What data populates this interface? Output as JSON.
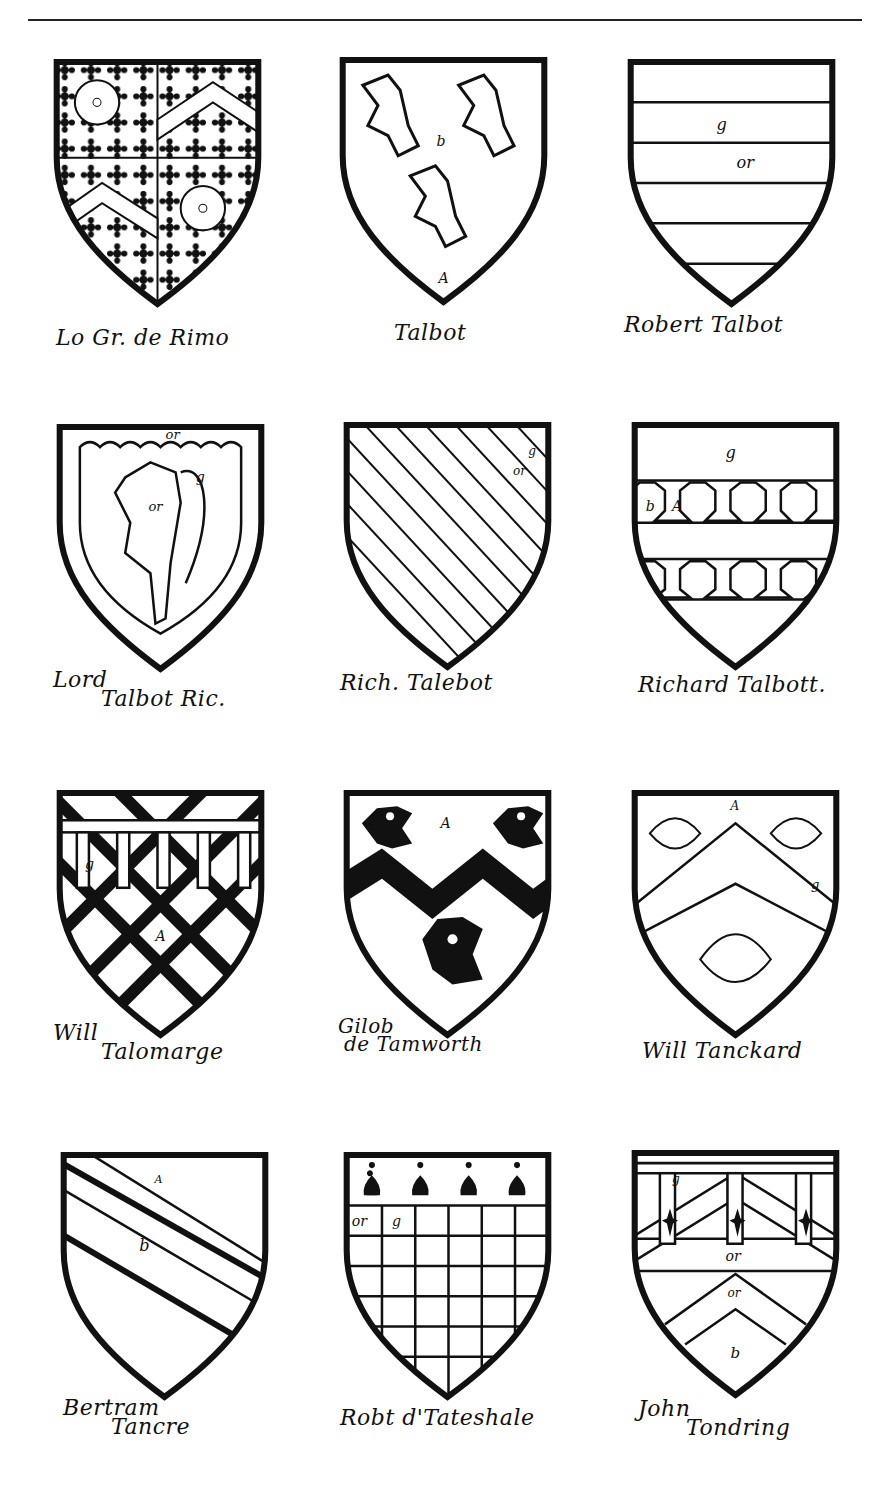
{
  "shields": [
    {
      "id": "r1c1",
      "caption_line1": "Lo Gr. de Rimo",
      "caption_line2": "",
      "labels": [
        "or",
        "g",
        "or",
        "or"
      ],
      "design": "quarterly-crusily-cinquefoil-chevron"
    },
    {
      "id": "r1c2",
      "caption_line1": "Talbot",
      "caption_line2": "",
      "labels": [
        "b",
        "A"
      ],
      "design": "three-lions-rampant"
    },
    {
      "id": "r1c3",
      "caption_line1": "Robert Talbot",
      "caption_line2": "",
      "labels": [
        "g",
        "or"
      ],
      "design": "barry"
    },
    {
      "id": "r2c1",
      "caption_line1": "Lord",
      "caption_line2": "Talbot Ric.",
      "labels": [
        "or",
        "or",
        "g"
      ],
      "design": "lion-within-bordure-engrailed"
    },
    {
      "id": "r2c2",
      "caption_line1": "Rich. Talebot",
      "caption_line2": "",
      "labels": [
        "g",
        "or"
      ],
      "design": "bendy"
    },
    {
      "id": "r2c3",
      "caption_line1": "Richard Talbott.",
      "caption_line2": "",
      "labels": [
        "g",
        "b",
        "A"
      ],
      "design": "two-bars-embattled"
    },
    {
      "id": "r3c1",
      "caption_line1": "Will",
      "caption_line2": "Talomarge",
      "labels": [
        "g",
        "A"
      ],
      "design": "fretty-label"
    },
    {
      "id": "r3c2",
      "caption_line1": "Gilob",
      "caption_line2": "de Tamworth",
      "labels": [
        "A"
      ],
      "design": "fess-dancetty-three-cocks-heads"
    },
    {
      "id": "r3c3",
      "caption_line1": "Will Tanckard",
      "caption_line2": "",
      "labels": [
        "A",
        "g"
      ],
      "design": "chevron-three-escallops"
    },
    {
      "id": "r4c1",
      "caption_line1": "Bertram",
      "caption_line2": "Tancre",
      "labels": [
        "A",
        "b"
      ],
      "design": "two-bendlets"
    },
    {
      "id": "r4c2",
      "caption_line1": "Robt d'Tateshale",
      "caption_line2": "",
      "labels": [
        "or",
        "g"
      ],
      "design": "checky-chief-ermine"
    },
    {
      "id": "r4c3",
      "caption_line1": "John",
      "caption_line2": "Tondring",
      "labels": [
        "g",
        "or",
        "or",
        "b"
      ],
      "design": "chevron-label-fleurs"
    }
  ]
}
